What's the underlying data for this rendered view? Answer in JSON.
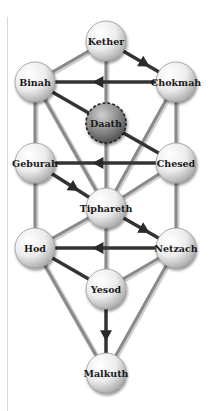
{
  "diagram": {
    "colors": {
      "path_gray": "#8a8a8a",
      "path_dark": "#333333",
      "node_light": "#f2f2f2",
      "node_dark": "#7a7a7a",
      "label": "#1a1a1a"
    },
    "nodes": [
      {
        "id": "kether",
        "label": "Kether",
        "x": 106,
        "y": 41
      },
      {
        "id": "binah",
        "label": "Binah",
        "x": 35,
        "y": 82
      },
      {
        "id": "chokmah",
        "label": "Chokmah",
        "x": 176,
        "y": 82
      },
      {
        "id": "daath",
        "label": "Daath",
        "x": 106,
        "y": 123,
        "style": "dashed-dark"
      },
      {
        "id": "geburah",
        "label": "Geburah",
        "x": 35,
        "y": 163
      },
      {
        "id": "chesed",
        "label": "Chesed",
        "x": 176,
        "y": 163
      },
      {
        "id": "tiphareth",
        "label": "Tiphareth",
        "x": 106,
        "y": 208
      },
      {
        "id": "hod",
        "label": "Hod",
        "x": 35,
        "y": 248
      },
      {
        "id": "netzach",
        "label": "Netzach",
        "x": 176,
        "y": 248
      },
      {
        "id": "yesod",
        "label": "Yesod",
        "x": 106,
        "y": 289
      },
      {
        "id": "malkuth",
        "label": "Malkuth",
        "x": 106,
        "y": 373
      }
    ],
    "edges": [
      {
        "from": "kether",
        "to": "binah",
        "style": "gray"
      },
      {
        "from": "kether",
        "to": "chokmah",
        "style": "dark",
        "arrow": true
      },
      {
        "from": "kether",
        "to": "daath",
        "style": "gray"
      },
      {
        "from": "chokmah",
        "to": "binah",
        "style": "dark",
        "arrow": true
      },
      {
        "from": "binah",
        "to": "daath",
        "style": "dark"
      },
      {
        "from": "daath",
        "to": "chesed",
        "style": "dark"
      },
      {
        "from": "binah",
        "to": "geburah",
        "style": "gray"
      },
      {
        "from": "chokmah",
        "to": "chesed",
        "style": "gray"
      },
      {
        "from": "binah",
        "to": "tiphareth",
        "style": "gray"
      },
      {
        "from": "chokmah",
        "to": "tiphareth",
        "style": "gray"
      },
      {
        "from": "daath",
        "to": "tiphareth",
        "style": "gray"
      },
      {
        "from": "chesed",
        "to": "geburah",
        "style": "dark",
        "arrow": true
      },
      {
        "from": "geburah",
        "to": "tiphareth",
        "style": "dark",
        "arrow": true
      },
      {
        "from": "chesed",
        "to": "tiphareth",
        "style": "gray"
      },
      {
        "from": "geburah",
        "to": "hod",
        "style": "gray"
      },
      {
        "from": "chesed",
        "to": "netzach",
        "style": "gray"
      },
      {
        "from": "tiphareth",
        "to": "netzach",
        "style": "dark",
        "arrow": true
      },
      {
        "from": "tiphareth",
        "to": "hod",
        "style": "gray"
      },
      {
        "from": "tiphareth",
        "to": "yesod",
        "style": "gray"
      },
      {
        "from": "netzach",
        "to": "hod",
        "style": "dark",
        "arrow": true
      },
      {
        "from": "hod",
        "to": "yesod",
        "style": "dark"
      },
      {
        "from": "netzach",
        "to": "yesod",
        "style": "gray"
      },
      {
        "from": "hod",
        "to": "malkuth",
        "style": "gray"
      },
      {
        "from": "netzach",
        "to": "malkuth",
        "style": "gray"
      },
      {
        "from": "yesod",
        "to": "malkuth",
        "style": "dark",
        "arrow": true
      }
    ]
  }
}
